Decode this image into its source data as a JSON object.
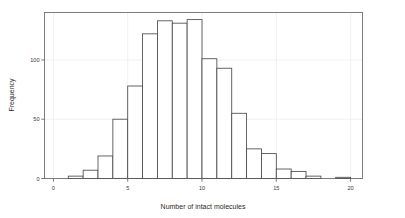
{
  "chart_data": {
    "type": "bar",
    "title": "",
    "subtitle": "",
    "xlabel": "Number of intact molecules",
    "ylabel": "Frequency",
    "xlim": [
      -0.6,
      20.8
    ],
    "ylim": [
      0,
      140
    ],
    "xticks": [
      0,
      5,
      10,
      15,
      20
    ],
    "xtick_labels": [
      "0",
      "5",
      "10",
      "15",
      "20"
    ],
    "yticks": [
      0,
      50,
      100
    ],
    "ytick_labels": [
      "0",
      "50",
      "100"
    ],
    "grid": true,
    "grid_axis": "both",
    "legend": null,
    "bin_width": 1,
    "bin_starts": [
      0,
      1,
      2,
      3,
      4,
      5,
      6,
      7,
      8,
      9,
      10,
      11,
      12,
      13,
      14,
      15,
      16,
      17,
      18,
      19
    ],
    "bin_ends": [
      1,
      2,
      3,
      4,
      5,
      6,
      7,
      8,
      9,
      10,
      11,
      12,
      13,
      14,
      15,
      16,
      17,
      18,
      19,
      20
    ],
    "categories": [
      "0-1",
      "1-2",
      "2-3",
      "3-4",
      "4-5",
      "5-6",
      "6-7",
      "7-8",
      "8-9",
      "9-10",
      "10-11",
      "11-12",
      "12-13",
      "13-14",
      "14-15",
      "15-16",
      "16-17",
      "17-18",
      "18-19",
      "19-20"
    ],
    "values": [
      0,
      2,
      7,
      19,
      50,
      78,
      122,
      133,
      131,
      134,
      101,
      93,
      55,
      25,
      21,
      8,
      6,
      2,
      0,
      1
    ],
    "series": [
      {
        "name": "Frequency",
        "values": [
          0,
          2,
          7,
          19,
          50,
          78,
          122,
          133,
          131,
          134,
          101,
          93,
          55,
          25,
          21,
          8,
          6,
          2,
          0,
          1
        ]
      }
    ],
    "bar_fill_color": "#ffffff",
    "bar_edge_color": "#4a4a4a",
    "grid_color": "#e9e9ef",
    "axis_color": "#6f6f76",
    "background_color": "#ffffff"
  },
  "axes": {
    "x_title": "Number of intact molecules",
    "y_title": "Frequency"
  }
}
